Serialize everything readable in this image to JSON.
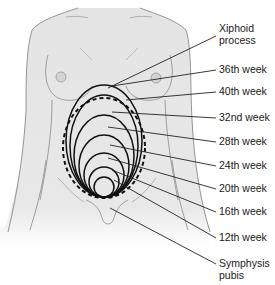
{
  "colors": {
    "skin": "#e6e6e6",
    "outline": "#8a8a8a",
    "ellipse": "#111111",
    "leader": "#222222",
    "text": "#1a1a1a"
  },
  "labels": [
    {
      "id": "xiphoid",
      "line1": "Xiphoid",
      "line2": "process",
      "top": 22
    },
    {
      "id": "week36",
      "line1": "36th week",
      "top": 63
    },
    {
      "id": "week40",
      "line1": "40th week",
      "top": 85
    },
    {
      "id": "week32",
      "line1": "32nd week",
      "top": 111
    },
    {
      "id": "week28",
      "line1": "28th week",
      "top": 135
    },
    {
      "id": "week24",
      "line1": "24th week",
      "top": 159
    },
    {
      "id": "week20",
      "line1": "20th week",
      "top": 182
    },
    {
      "id": "week16",
      "line1": "16th week",
      "top": 205
    },
    {
      "id": "week12",
      "line1": "12th week",
      "top": 231
    },
    {
      "id": "symphysis",
      "line1": "Symphysis",
      "line2": "pubis",
      "top": 257
    }
  ]
}
